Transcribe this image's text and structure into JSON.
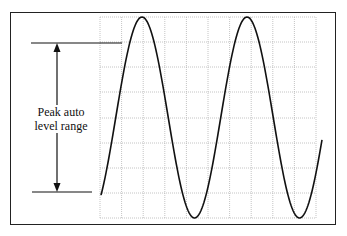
{
  "diagram": {
    "annotation": {
      "line1": "Peak auto",
      "line2": "level range"
    },
    "grid": {
      "columns": 10,
      "rows": 8
    },
    "waveform": {
      "type": "sine",
      "cycles_visible": 2
    },
    "colors": {
      "line": "#111111",
      "grid": "#b0b0b0",
      "frame": "#222222"
    }
  }
}
